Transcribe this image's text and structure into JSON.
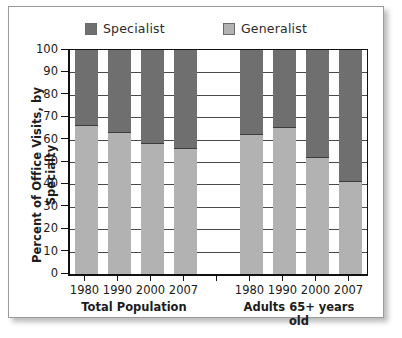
{
  "chart_data": {
    "type": "bar",
    "subtype": "stacked-bar-100",
    "title": "",
    "xlabel": "",
    "ylabel": "Percent of Office Visits, by Specialty",
    "ylim": [
      0,
      100
    ],
    "ytick_values": [
      100,
      90,
      80,
      70,
      60,
      50,
      40,
      30,
      20,
      10,
      0
    ],
    "ytick_labels": [
      "100",
      "90",
      "80",
      "70",
      "60",
      "50",
      "40",
      "30",
      "20",
      "10",
      "0"
    ],
    "grid": true,
    "legend_position": "top-center",
    "legend": [
      {
        "label": "Specialist",
        "color": "#6f6f6f"
      },
      {
        "label": "Generalist",
        "color": "#b2b2b2"
      }
    ],
    "groups": [
      {
        "name": "Total Population",
        "categories": [
          "1980",
          "1990",
          "2000",
          "2007"
        ]
      },
      {
        "name": "Adults 65+ years old",
        "categories": [
          "1980",
          "1990",
          "2000",
          "2007"
        ]
      }
    ],
    "categories": [
      "1980",
      "1990",
      "2000",
      "2007",
      "",
      "1980",
      "1990",
      "2000",
      "2007"
    ],
    "series": [
      {
        "name": "Generalist",
        "color": "#b2b2b2",
        "values": [
          66,
          63,
          58,
          56,
          null,
          62,
          65,
          52,
          41
        ]
      },
      {
        "name": "Specialist",
        "color": "#6f6f6f",
        "values": [
          34,
          37,
          42,
          44,
          null,
          38,
          35,
          48,
          59
        ]
      }
    ],
    "slots": [
      {
        "category": "1980",
        "group": "Total Population",
        "generalist": 66,
        "specialist": 34,
        "empty": false
      },
      {
        "category": "1990",
        "group": "Total Population",
        "generalist": 63,
        "specialist": 37,
        "empty": false
      },
      {
        "category": "2000",
        "group": "Total Population",
        "generalist": 58,
        "specialist": 42,
        "empty": false
      },
      {
        "category": "2007",
        "group": "Total Population",
        "generalist": 56,
        "specialist": 44,
        "empty": false
      },
      {
        "category": "",
        "group": "",
        "generalist": 0,
        "specialist": 0,
        "empty": true
      },
      {
        "category": "1980",
        "group": "Adults 65+ years old",
        "generalist": 62,
        "specialist": 38,
        "empty": false
      },
      {
        "category": "1990",
        "group": "Adults 65+ years old",
        "generalist": 65,
        "specialist": 35,
        "empty": false
      },
      {
        "category": "2000",
        "group": "Adults 65+ years old",
        "generalist": 52,
        "specialist": 48,
        "empty": false
      },
      {
        "category": "2007",
        "group": "Adults 65+ years old",
        "generalist": 41,
        "specialist": 59,
        "empty": false
      }
    ]
  },
  "colors": {
    "specialist": "#6f6f6f",
    "generalist": "#b2b2b2",
    "axis": "#111111",
    "gridline": "#4a4a4a",
    "frame_border": "#9a9a9a",
    "background": "#ffffff"
  }
}
